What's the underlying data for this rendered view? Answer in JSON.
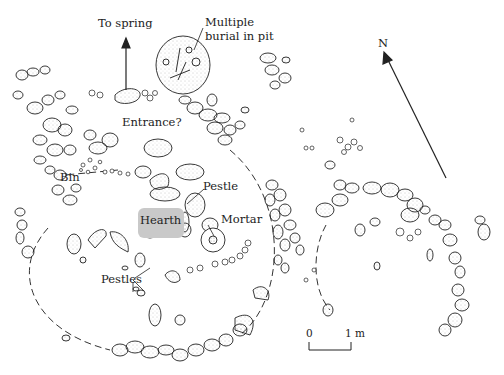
{
  "diagram": {
    "type": "archaeological site plan",
    "labels": {
      "to_spring": "To spring",
      "multiple_burial_line1": "Multiple",
      "multiple_burial_line2": "burial in pit",
      "entrance": "Entrance?",
      "bin": "Bin",
      "pestle": "Pestle",
      "hearth": "Hearth",
      "mortar": "Mortar",
      "pestles": "Pestles",
      "north": "N"
    },
    "scale_bar": {
      "start": "0",
      "end": "1 m"
    },
    "colors": {
      "ink": "#222222",
      "stone_fill": "#f4f4f4",
      "stipple": "#9a9a9a",
      "hearth_fill": "#c9c9c9",
      "background": "#ffffff"
    }
  }
}
